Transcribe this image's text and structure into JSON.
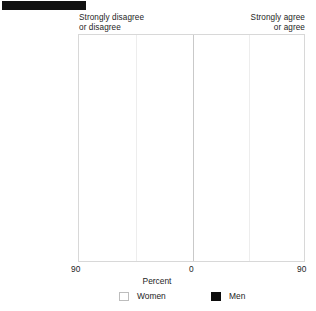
{
  "title_bar": {
    "name": "redacted-title-bar",
    "color": "#111111"
  },
  "headers": {
    "left": "Strongly disagree\nor disagree",
    "right": "Strongly agree\nor agree"
  },
  "axis": {
    "left_label": "90",
    "center_label": "0",
    "right_label": "90",
    "title": "Percent"
  },
  "legend": {
    "women_label": "Women",
    "men_label": "Men",
    "women_color": "#ffffff",
    "men_color": "#0d0d0d"
  },
  "categories": [
    {
      "label": "Not religious"
    },
    {
      "label": "Slightly religious"
    },
    {
      "label": "Religious"
    },
    {
      "label": "Very religious"
    }
  ],
  "chart_data": {
    "type": "bar",
    "orientation": "horizontal",
    "subtype": "diverging-paired",
    "title": "",
    "xlabel": "Percent",
    "ylabel": "",
    "xlim": [
      -90,
      90
    ],
    "xticks": [
      -90,
      0,
      90
    ],
    "grid": false,
    "legend_position": "bottom",
    "categories": [
      "Not religious",
      "Slightly religious",
      "Religious",
      "Very religious"
    ],
    "note": "Negative values extend left (Strongly disagree or disagree); positive values extend right (Strongly agree or agree).",
    "series": [
      {
        "name": "Men",
        "color": "#0d0d0d",
        "disagree": [
          73,
          52,
          32,
          10
        ],
        "agree": [
          12,
          27,
          42,
          58
        ],
        "spans": [
          [
            -73,
            12
          ],
          [
            -52,
            27
          ],
          [
            -32,
            42
          ],
          [
            -10,
            58
          ]
        ]
      },
      {
        "name": "Women",
        "color": "#ffffff",
        "disagree": [
          78,
          58,
          38,
          18
        ],
        "agree": [
          8,
          22,
          37,
          53
        ],
        "spans": [
          [
            -78,
            8
          ],
          [
            -58,
            22
          ],
          [
            -38,
            37
          ],
          [
            -18,
            53
          ]
        ]
      }
    ]
  }
}
